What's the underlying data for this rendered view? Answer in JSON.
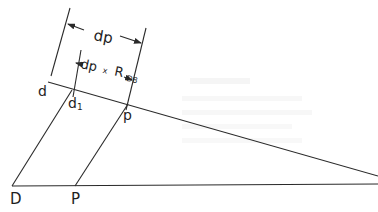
{
  "diagram": {
    "type": "geometric construction / dimension diagram",
    "labels": {
      "d": "d",
      "d1_base": "d",
      "d1_sub": "1",
      "p_upper": "p",
      "D": "D",
      "P": "P",
      "dim_outer": "dp",
      "dim_inner_base": "dp",
      "dim_inner_times": "x",
      "dim_inner_R": "R",
      "dim_inner_sub": "D8"
    },
    "points": {
      "D": [
        12,
        186
      ],
      "P": [
        75,
        186
      ],
      "d": [
        50,
        83
      ],
      "d1": [
        72,
        90
      ],
      "p": [
        128,
        106
      ],
      "upper_end": [
        378,
        176
      ],
      "lower_end": [
        378,
        184
      ]
    },
    "colors": {
      "line": "#2a2a2a",
      "background": "#ffffff"
    }
  }
}
